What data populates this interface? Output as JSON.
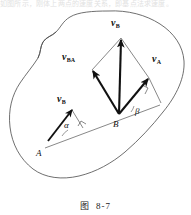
{
  "figure": {
    "caption_prefix": "图",
    "caption_number": "8-7",
    "cut_header_text": "如图所示，刚体上两点的速度关系，即基点法求速度。",
    "stroke_color": "#111111",
    "outline_color": "#444444",
    "background": "#ffffff"
  },
  "points": [
    {
      "id": "A",
      "label": "A",
      "x": 40,
      "y": 152
    },
    {
      "id": "B",
      "label": "B",
      "x": 117,
      "y": 122
    }
  ],
  "vectors": [
    {
      "id": "vB-at-A",
      "name": "v_B at A",
      "base": "v",
      "sub": "B",
      "from": [
        48,
        141
      ],
      "to": [
        72,
        110
      ]
    },
    {
      "id": "vB-at-B",
      "name": "v_B at B",
      "base": "v",
      "sub": "B",
      "from": [
        119,
        114
      ],
      "to": [
        121,
        38
      ]
    },
    {
      "id": "vBA",
      "name": "v_BA relative",
      "base": "v",
      "sub": "BA",
      "from": [
        119,
        114
      ],
      "to": [
        92,
        70
      ]
    },
    {
      "id": "vA",
      "name": "v_A at B",
      "base": "v",
      "sub": "A",
      "from": [
        119,
        114
      ],
      "to": [
        149,
        78
      ]
    }
  ],
  "labels": {
    "vB_topleft": {
      "base": "v",
      "sub": "B",
      "x": 59,
      "y": 98
    },
    "vB_top": {
      "base": "v",
      "sub": "B",
      "x": 113,
      "y": 22
    },
    "vBA": {
      "base": "v",
      "sub": "BA",
      "x": 66,
      "y": 56
    },
    "vA": {
      "base": "v",
      "sub": "A",
      "x": 153,
      "y": 58
    },
    "alpha": {
      "text": "α",
      "x": 66,
      "y": 125
    },
    "beta": {
      "text": "β",
      "x": 136,
      "y": 112
    },
    "A": {
      "text": "A",
      "x": 38,
      "y": 154
    },
    "B": {
      "text": "B",
      "x": 114,
      "y": 124
    }
  },
  "angles": [
    {
      "id": "alpha",
      "symbol": "α",
      "at": "A",
      "between": [
        "v_B",
        "AB-line"
      ]
    },
    {
      "id": "beta",
      "symbol": "β",
      "at": "B",
      "between": [
        "v_A",
        "AB-line"
      ]
    }
  ],
  "right_angle_marks": [
    {
      "id": "right-angle-at-A-projection",
      "x": 81,
      "y": 124
    },
    {
      "id": "right-angle-at-B-projection",
      "x": 145,
      "y": 90
    }
  ],
  "construction": {
    "parallelogram": "v_B = v_A + v_BA",
    "diagonal": "v_B",
    "sides": [
      "v_A",
      "v_BA"
    ]
  }
}
